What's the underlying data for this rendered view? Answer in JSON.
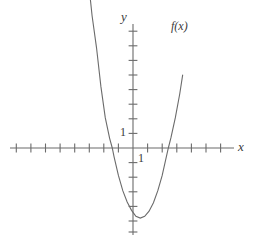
{
  "figure": {
    "title": "",
    "background_color": "#ffffff",
    "width": 261,
    "height": 245
  },
  "labels": {
    "y_axis": "y",
    "x_axis": "x",
    "curve": "f(x)",
    "y_unit_tick": "1",
    "x_unit_tick": "1"
  },
  "colors": {
    "curve": "#6b6b6b",
    "axis": "#6b6b6b",
    "tick": "#6b6b6b",
    "text": "#3a3a3a"
  },
  "chart_data": {
    "type": "line",
    "title": "",
    "xlabel": "x",
    "ylabel": "y",
    "grid": false,
    "legend": [
      "f(x)"
    ],
    "annotations": [
      "f(x)",
      "1",
      "1",
      "x",
      "y"
    ],
    "axis": {
      "origin_px": [
        133,
        148
      ],
      "unit_px": 14.6,
      "x_axis_y_px": 148,
      "y_axis_x_px": 133,
      "x_tick_count_left": 8,
      "x_tick_count_right": 7,
      "y_tick_count_up": 7,
      "y_tick_count_down": 6
    },
    "xlim": [
      -8.6,
      7.5
    ],
    "ylim": [
      -6.5,
      7.8
    ],
    "x_tick_values": [
      -8,
      -7,
      -6,
      -5,
      -4,
      -3,
      -2,
      -1,
      1,
      2,
      3,
      4,
      5,
      6,
      7
    ],
    "y_tick_values": [
      -6,
      -5,
      -4,
      -3,
      -2,
      -1,
      1,
      2,
      3,
      4,
      5,
      6,
      7
    ],
    "xtick_labels_shown": [
      "1"
    ],
    "ytick_labels_shown": [
      "1"
    ],
    "series": [
      {
        "name": "f(x)",
        "type": "parabola",
        "equation": "y = 1.3*(x - 0.5)^2 - 4.8",
        "vertex": [
          0.5,
          -4.8
        ],
        "leading_coefficient": 1.3,
        "x_intercepts": [
          -1.42,
          2.42
        ],
        "y_intercept": -4.48,
        "x_domain": [
          -3.1,
          3.4
        ],
        "x": [
          -3.1,
          -2.8,
          -2.5,
          -2.2,
          -1.9,
          -1.6,
          -1.42,
          -1.3,
          -1.0,
          -0.7,
          -0.4,
          -0.1,
          0.2,
          0.5,
          0.8,
          1.1,
          1.4,
          1.7,
          2.0,
          2.42,
          2.6,
          2.9,
          3.2,
          3.4
        ],
        "y": [
          11.88,
          9.04,
          6.88,
          4.22,
          2.08,
          0.66,
          0.0,
          -0.59,
          -1.88,
          -2.92,
          -3.7,
          -4.27,
          -4.68,
          -4.8,
          -4.68,
          -4.33,
          -3.75,
          -2.92,
          -1.88,
          0.0,
          0.71,
          2.08,
          3.7,
          4.99
        ]
      }
    ]
  }
}
